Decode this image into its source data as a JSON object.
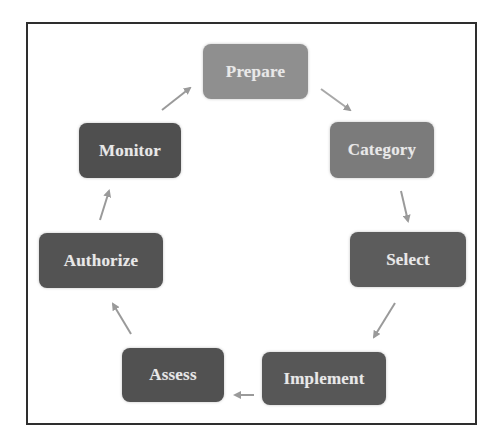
{
  "diagram": {
    "type": "cycle",
    "nodes": [
      {
        "id": "prepare",
        "label": "Prepare",
        "color": "#8f8f8f"
      },
      {
        "id": "category",
        "label": "Category",
        "color": "#7b7b7b"
      },
      {
        "id": "select",
        "label": "Select",
        "color": "#5c5c5c"
      },
      {
        "id": "implement",
        "label": "Implement",
        "color": "#575757"
      },
      {
        "id": "assess",
        "label": "Assess",
        "color": "#515151"
      },
      {
        "id": "authorize",
        "label": "Authorize",
        "color": "#535353"
      },
      {
        "id": "monitor",
        "label": "Monitor",
        "color": "#4f4f4f"
      }
    ],
    "edges": [
      {
        "from": "prepare",
        "to": "category"
      },
      {
        "from": "category",
        "to": "select"
      },
      {
        "from": "select",
        "to": "implement"
      },
      {
        "from": "implement",
        "to": "assess"
      },
      {
        "from": "assess",
        "to": "authorize"
      },
      {
        "from": "authorize",
        "to": "monitor"
      },
      {
        "from": "monitor",
        "to": "prepare"
      }
    ],
    "arrow_color": "#9a9a9a",
    "frame_color": "#2e2e2e",
    "text_color": "#e8e8e8"
  }
}
